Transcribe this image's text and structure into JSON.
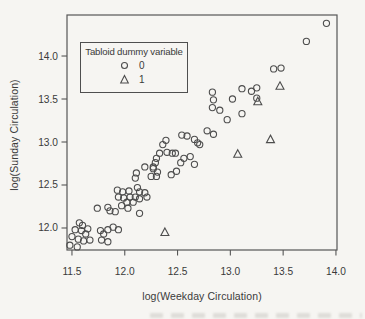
{
  "figure": {
    "background": "#f6f5f2",
    "ink": "#4d4d4d",
    "text_color": "#3a3a3a"
  },
  "chart_data": {
    "type": "scatter",
    "title": "",
    "xlabel": "log(Weekday Circulation)",
    "ylabel": "log(Sunday Circulation)",
    "xlim": [
      11.453,
      14.01
    ],
    "ylim": [
      11.744,
      14.477
    ],
    "x_ticks": [
      11.5,
      12.0,
      12.5,
      13.0,
      13.5,
      14.0
    ],
    "y_ticks": [
      12.0,
      12.5,
      13.0,
      13.5,
      14.0
    ],
    "grid": false,
    "legend": {
      "title": "Tabloid dummy variable",
      "position": "upper-left",
      "items": [
        {
          "label": "0",
          "marker": "circle"
        },
        {
          "label": "1",
          "marker": "triangle"
        }
      ]
    },
    "series": [
      {
        "name": "0",
        "marker": "circle",
        "points": [
          [
            13.91,
            14.38
          ],
          [
            13.72,
            14.17
          ],
          [
            13.48,
            13.86
          ],
          [
            13.41,
            13.85
          ],
          [
            13.25,
            13.63
          ],
          [
            13.2,
            13.59
          ],
          [
            13.11,
            13.62
          ],
          [
            13.25,
            13.51
          ],
          [
            12.83,
            13.58
          ],
          [
            12.84,
            13.49
          ],
          [
            13.02,
            13.5
          ],
          [
            12.83,
            13.4
          ],
          [
            12.9,
            13.37
          ],
          [
            13.11,
            13.33
          ],
          [
            12.97,
            13.26
          ],
          [
            12.78,
            13.13
          ],
          [
            12.84,
            13.09
          ],
          [
            12.71,
            12.97
          ],
          [
            12.39,
            13.02
          ],
          [
            12.36,
            12.97
          ],
          [
            12.54,
            13.08
          ],
          [
            12.59,
            13.07
          ],
          [
            12.66,
            13.03
          ],
          [
            12.69,
            12.99
          ],
          [
            12.33,
            12.87
          ],
          [
            12.4,
            12.88
          ],
          [
            12.45,
            12.87
          ],
          [
            12.48,
            12.87
          ],
          [
            12.56,
            12.81
          ],
          [
            12.53,
            12.76
          ],
          [
            12.62,
            12.83
          ],
          [
            12.66,
            12.74
          ],
          [
            12.3,
            12.81
          ],
          [
            12.29,
            12.76
          ],
          [
            12.27,
            12.71
          ],
          [
            12.19,
            12.71
          ],
          [
            12.27,
            12.69
          ],
          [
            12.31,
            12.65
          ],
          [
            12.11,
            12.64
          ],
          [
            12.1,
            12.58
          ],
          [
            12.25,
            12.6
          ],
          [
            12.3,
            12.6
          ],
          [
            12.49,
            12.66
          ],
          [
            12.44,
            12.62
          ],
          [
            11.93,
            12.44
          ],
          [
            11.98,
            12.42
          ],
          [
            12.04,
            12.43
          ],
          [
            12.12,
            12.47
          ],
          [
            12.14,
            12.42
          ],
          [
            12.19,
            12.41
          ],
          [
            11.94,
            12.36
          ],
          [
            11.99,
            12.35
          ],
          [
            12.05,
            12.36
          ],
          [
            12.1,
            12.36
          ],
          [
            12.02,
            12.3
          ],
          [
            12.08,
            12.3
          ],
          [
            11.97,
            12.26
          ],
          [
            12.03,
            12.23
          ],
          [
            12.14,
            12.34
          ],
          [
            12.21,
            12.36
          ],
          [
            11.86,
            12.2
          ],
          [
            11.91,
            12.19
          ],
          [
            12.14,
            12.17
          ],
          [
            11.74,
            12.23
          ],
          [
            11.84,
            12.24
          ],
          [
            11.57,
            12.06
          ],
          [
            11.6,
            12.03
          ],
          [
            11.53,
            11.98
          ],
          [
            11.59,
            11.97
          ],
          [
            11.65,
            11.99
          ],
          [
            11.63,
            11.93
          ],
          [
            11.56,
            11.87
          ],
          [
            11.5,
            11.9
          ],
          [
            11.61,
            11.85
          ],
          [
            11.67,
            11.86
          ],
          [
            11.77,
            11.97
          ],
          [
            11.8,
            11.93
          ],
          [
            11.84,
            11.98
          ],
          [
            11.89,
            12.01
          ],
          [
            11.94,
            11.98
          ],
          [
            11.78,
            11.86
          ],
          [
            11.84,
            11.84
          ],
          [
            11.48,
            11.8
          ],
          [
            11.55,
            11.78
          ]
        ]
      },
      {
        "name": "1",
        "marker": "triangle",
        "points": [
          [
            13.47,
            13.65
          ],
          [
            13.26,
            13.47
          ],
          [
            13.38,
            13.03
          ],
          [
            13.07,
            12.86
          ],
          [
            12.38,
            11.95
          ]
        ]
      }
    ]
  }
}
